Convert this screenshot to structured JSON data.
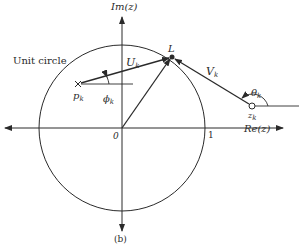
{
  "figure": {
    "caption": "(b)",
    "colors": {
      "ink": "#2a2a2a",
      "background": "#ffffff"
    }
  },
  "axes": {
    "imag_label": "Im(z)",
    "real_label": "Re(z)",
    "origin_label": "0",
    "unit_tick_label": "1"
  },
  "circle": {
    "label": "Unit circle"
  },
  "points": {
    "pole": {
      "symbol": "×",
      "label_main": "p",
      "label_sub": "k"
    },
    "zero": {
      "symbol": "o",
      "label_main": "z",
      "label_sub": "k"
    },
    "L": {
      "label": "L"
    }
  },
  "vectors": {
    "U": {
      "label_main": "U",
      "label_sub": "k"
    },
    "V": {
      "label_main": "V",
      "label_sub": "k"
    }
  },
  "angles": {
    "phi": {
      "label_main": "ϕ",
      "label_sub": "k"
    },
    "theta": {
      "label_main": "θ",
      "label_sub": "k"
    }
  }
}
